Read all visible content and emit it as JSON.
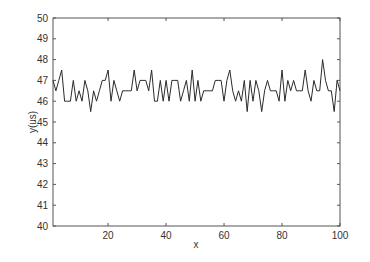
{
  "chart_data": {
    "type": "line",
    "title": "",
    "xlabel": "x",
    "ylabel": "y(us)",
    "xlim": [
      1,
      100
    ],
    "ylim": [
      40,
      50
    ],
    "grid": false,
    "legend": null,
    "x_ticks": [
      20,
      40,
      60,
      80,
      100
    ],
    "y_ticks": [
      40,
      41,
      42,
      43,
      44,
      45,
      46,
      47,
      48,
      49,
      50
    ],
    "series": [
      {
        "name": "y",
        "color": "#2a2a2a",
        "x": [
          1,
          2,
          3,
          4,
          5,
          6,
          7,
          8,
          9,
          10,
          11,
          12,
          13,
          14,
          15,
          16,
          17,
          18,
          19,
          20,
          21,
          22,
          23,
          24,
          25,
          26,
          27,
          28,
          29,
          30,
          31,
          32,
          33,
          34,
          35,
          36,
          37,
          38,
          39,
          40,
          41,
          42,
          43,
          44,
          45,
          46,
          47,
          48,
          49,
          50,
          51,
          52,
          53,
          54,
          55,
          56,
          57,
          58,
          59,
          60,
          61,
          62,
          63,
          64,
          65,
          66,
          67,
          68,
          69,
          70,
          71,
          72,
          73,
          74,
          75,
          76,
          77,
          78,
          79,
          80,
          81,
          82,
          83,
          84,
          85,
          86,
          87,
          88,
          89,
          90,
          91,
          92,
          93,
          94,
          95,
          96,
          97,
          98,
          99,
          100
        ],
        "values": [
          47,
          46.5,
          47,
          47.5,
          46,
          46,
          46,
          47,
          46,
          46.5,
          46,
          47,
          46.5,
          45.5,
          46.5,
          46,
          46.5,
          47,
          47,
          47.5,
          46,
          47,
          46.5,
          46,
          46.5,
          46.5,
          46.5,
          46.5,
          47.5,
          46.5,
          47,
          47,
          47,
          46.5,
          47.5,
          46,
          46,
          47,
          46,
          47,
          46,
          47,
          47,
          47,
          46,
          46.5,
          47,
          46,
          47.5,
          46,
          47,
          46,
          46.5,
          46.5,
          46.5,
          46.5,
          47,
          47,
          47,
          46,
          47,
          47.5,
          46.5,
          46,
          46.5,
          46,
          47,
          45.5,
          47,
          46,
          47,
          46.5,
          45.5,
          46.5,
          47,
          46.5,
          46.5,
          46.5,
          46,
          47.5,
          46,
          47,
          46.5,
          47,
          46.5,
          46.5,
          46.5,
          47.5,
          46.5,
          46,
          47,
          46.5,
          46.5,
          48,
          47,
          46.5,
          46.5,
          45.5,
          47,
          46.5
        ]
      }
    ]
  },
  "colors": {
    "axis": "#555555",
    "line": "#2a2a2a",
    "background": "#ffffff"
  }
}
